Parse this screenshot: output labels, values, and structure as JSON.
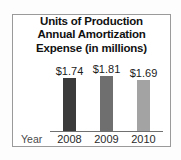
{
  "chart_data": {
    "type": "bar",
    "title": "Units of Production Annual Amortization Expense (in millions)",
    "title_lines": [
      "Units of Production",
      "Annual Amortization",
      "Expense (in millions)"
    ],
    "xlabel": "Year",
    "ylabel": "",
    "categories": [
      "2008",
      "2009",
      "2010"
    ],
    "values": [
      1.74,
      1.81,
      1.69
    ],
    "data_labels": [
      "$1.74",
      "$1.81",
      "$1.69"
    ],
    "bar_colors": [
      "#3b3b3b",
      "#6f6f6f",
      "#a3a3a3"
    ],
    "ylim": [
      0,
      2.0
    ],
    "grid": false,
    "legend": "none",
    "units": "millions of dollars",
    "currency_symbol": "$"
  },
  "frame": {
    "border_color": "#9a9a9a",
    "background": "#ffffff"
  },
  "axis": {
    "baseline_color": "#707070"
  }
}
